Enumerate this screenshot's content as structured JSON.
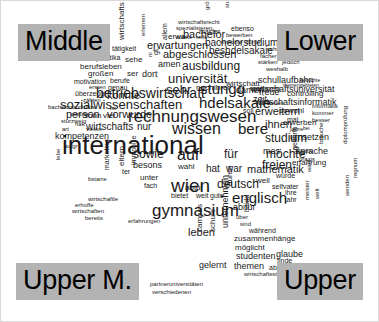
{
  "figure": {
    "type": "word-cloud",
    "title": "",
    "background_color": "#ffffff",
    "text_color": "#1a1a1a",
    "label_background_color": "#b3b3b3"
  },
  "corner_labels": {
    "top_left": "Middle",
    "top_right": "Lower",
    "bottom_left": "Upper M.",
    "bottom_right": "Upper"
  },
  "chart_data": {
    "type": "word-cloud",
    "title": "",
    "xlabel": "",
    "ylabel": "",
    "legend": [],
    "quadrant_labels": [
      "Middle",
      "Lower",
      "Upper M.",
      "Upper"
    ],
    "words": [
      {
        "text": "international",
        "size": 26,
        "x": 62,
        "y": 132,
        "rot": 0
      },
      {
        "text": "rechnungswesen",
        "size": 17,
        "x": 128,
        "y": 108,
        "rot": 0
      },
      {
        "text": "betriebswirtschaft",
        "size": 14,
        "x": 96,
        "y": 86,
        "rot": 0
      },
      {
        "text": "sozialwissenschaften",
        "size": 13,
        "x": 60,
        "y": 98,
        "rot": 0
      },
      {
        "text": "gymnasium",
        "size": 17,
        "x": 152,
        "y": 202,
        "rot": 0
      },
      {
        "text": "wissen",
        "size": 16,
        "x": 172,
        "y": 121,
        "rot": 0
      },
      {
        "text": "wien",
        "size": 19,
        "x": 171,
        "y": 176,
        "rot": 0
      },
      {
        "text": "englisch",
        "size": 15,
        "x": 232,
        "y": 190,
        "rot": 0
      },
      {
        "text": "hdelsakaie",
        "size": 15,
        "x": 199,
        "y": 95,
        "rot": 0
      },
      {
        "text": "stungg",
        "size": 15,
        "x": 200,
        "y": 81,
        "rot": 0
      },
      {
        "text": "auf",
        "size": 16,
        "x": 177,
        "y": 147,
        "rot": 0
      },
      {
        "text": "sehr",
        "size": 13,
        "x": 166,
        "y": 83,
        "rot": 0
      },
      {
        "text": "universität",
        "size": 13,
        "x": 168,
        "y": 72,
        "rot": 0
      },
      {
        "text": "ausbildung",
        "size": 12,
        "x": 182,
        "y": 60,
        "rot": 0
      },
      {
        "text": "abgeschlossen",
        "size": 11,
        "x": 163,
        "y": 49,
        "rot": 0
      },
      {
        "text": "bachelorstudium",
        "size": 10,
        "x": 205,
        "y": 38,
        "rot": 0
      },
      {
        "text": "bachelor",
        "size": 11,
        "x": 183,
        "y": 29,
        "rot": 0
      },
      {
        "text": "erwartungen",
        "size": 11,
        "x": 147,
        "y": 40,
        "rot": 0
      },
      {
        "text": "beshdelsakaie",
        "size": 10,
        "x": 209,
        "y": 46,
        "rot": 0
      },
      {
        "text": "studium",
        "size": 12,
        "x": 265,
        "y": 132,
        "rot": 0
      },
      {
        "text": "erweitern",
        "size": 11,
        "x": 255,
        "y": 106,
        "rot": 0
      },
      {
        "text": "ihnen",
        "size": 11,
        "x": 265,
        "y": 119,
        "rot": 0
      },
      {
        "text": "möchte",
        "size": 12,
        "x": 266,
        "y": 148,
        "rot": 0
      },
      {
        "text": "freien",
        "size": 12,
        "x": 262,
        "y": 159,
        "rot": 0
      },
      {
        "text": "wirtschaftsuniversität",
        "size": 9,
        "x": 251,
        "y": 85,
        "rot": 0
      },
      {
        "text": "wirtschaftsinformatik",
        "size": 9,
        "x": 255,
        "y": 98,
        "rot": 0
      },
      {
        "text": "schullaufbahn",
        "size": 9,
        "x": 258,
        "y": 76,
        "rot": 0
      },
      {
        "text": "bere",
        "size": 15,
        "x": 238,
        "y": 121,
        "rot": 0
      },
      {
        "text": "deutsch",
        "size": 12,
        "x": 217,
        "y": 178,
        "rot": 0
      },
      {
        "text": "mathematik",
        "size": 11,
        "x": 247,
        "y": 164,
        "rot": 0
      },
      {
        "text": "für",
        "size": 12,
        "x": 224,
        "y": 148,
        "rot": 0
      },
      {
        "text": "sowie",
        "size": 12,
        "x": 133,
        "y": 148,
        "rot": 0
      },
      {
        "text": "hat",
        "size": 10,
        "x": 206,
        "y": 164,
        "rot": 0
      },
      {
        "text": "war",
        "size": 10,
        "x": 226,
        "y": 164,
        "rot": 0
      },
      {
        "text": "person",
        "size": 11,
        "x": 66,
        "y": 109,
        "rot": 0
      },
      {
        "text": "vorwurde",
        "size": 11,
        "x": 107,
        "y": 109,
        "rot": 0
      },
      {
        "text": "wirtschafts",
        "size": 10,
        "x": 86,
        "y": 122,
        "rot": 0
      },
      {
        "text": "nur",
        "size": 10,
        "x": 137,
        "y": 122,
        "rot": 0
      },
      {
        "text": "kompetenzen",
        "size": 9,
        "x": 55,
        "y": 132,
        "rot": 0
      },
      {
        "text": "konnte",
        "size": 11,
        "x": 107,
        "y": 90,
        "rot": 0
      },
      {
        "text": "leben",
        "size": 11,
        "x": 188,
        "y": 227,
        "rot": 0
      },
      {
        "text": "zusammenhänge",
        "size": 8,
        "x": 234,
        "y": 235,
        "rot": 0
      },
      {
        "text": "studenten",
        "size": 9,
        "x": 236,
        "y": 252,
        "rot": 0
      },
      {
        "text": "gelernt",
        "size": 9,
        "x": 199,
        "y": 261,
        "rot": 0
      },
      {
        "text": "themen",
        "size": 9,
        "x": 234,
        "y": 262,
        "rot": 0
      },
      {
        "text": "glaube",
        "size": 9,
        "x": 276,
        "y": 250,
        "rot": 0
      },
      {
        "text": "möglicht",
        "size": 8,
        "x": 235,
        "y": 244,
        "rot": 0
      },
      {
        "text": "absolviert",
        "size": 7,
        "x": 269,
        "y": 264,
        "rot": 0
      },
      {
        "text": "wirtschaftsstudium",
        "size": 6,
        "x": 244,
        "y": 271,
        "rot": 0
      },
      {
        "text": "partneruniversitäten",
        "size": 6,
        "x": 150,
        "y": 281,
        "rot": 0
      },
      {
        "text": "verschiedenen",
        "size": 6,
        "x": 152,
        "y": 289,
        "rot": 0
      },
      {
        "text": "während",
        "size": 7,
        "x": 249,
        "y": 227,
        "rot": 0
      },
      {
        "text": "sind",
        "size": 6,
        "x": 240,
        "y": 221,
        "rot": 0
      },
      {
        "text": "über",
        "size": 6,
        "x": 236,
        "y": 214,
        "rot": 0
      },
      {
        "text": "abitur",
        "size": 9,
        "x": 233,
        "y": 203,
        "rot": 0
      },
      {
        "text": "finde",
        "size": 7,
        "x": 277,
        "y": 257,
        "rot": 0
      },
      {
        "text": "gute",
        "size": 7,
        "x": 210,
        "y": 192,
        "rot": 0
      },
      {
        "text": "weit",
        "size": 7,
        "x": 196,
        "y": 192,
        "rot": 0
      },
      {
        "text": "bietet",
        "size": 7,
        "x": 171,
        "y": 192,
        "rot": 0
      },
      {
        "text": "abtur",
        "size": 8,
        "x": 185,
        "y": 184,
        "rot": 0
      },
      {
        "text": "wahl",
        "size": 8,
        "x": 178,
        "y": 163,
        "rot": 0
      },
      {
        "text": "besons",
        "size": 9,
        "x": 133,
        "y": 161,
        "rot": 0
      },
      {
        "text": "weil",
        "size": 8,
        "x": 256,
        "y": 177,
        "rot": 0
      },
      {
        "text": "würde",
        "size": 7,
        "x": 276,
        "y": 172,
        "rot": 0
      },
      {
        "text": "selfvater",
        "size": 7,
        "x": 272,
        "y": 183,
        "rot": 0
      },
      {
        "text": "ihre",
        "size": 7,
        "x": 285,
        "y": 189,
        "rot": 0
      },
      {
        "text": "jahr",
        "size": 7,
        "x": 285,
        "y": 196,
        "rot": 0
      },
      {
        "text": "mes",
        "size": 9,
        "x": 263,
        "y": 147,
        "rot": 0
      },
      {
        "text": "sprache",
        "size": 9,
        "x": 296,
        "y": 147,
        "rot": 0
      },
      {
        "text": "erfahrung",
        "size": 8,
        "x": 292,
        "y": 159,
        "rot": 0
      },
      {
        "text": "zeit",
        "size": 9,
        "x": 253,
        "y": 95,
        "rot": 0
      },
      {
        "text": "umsetzen",
        "size": 9,
        "x": 290,
        "y": 133,
        "rot": 0
      },
      {
        "text": "erwerben",
        "size": 8,
        "x": 283,
        "y": 119,
        "rot": 0
      },
      {
        "text": "sowohl",
        "size": 8,
        "x": 279,
        "y": 107,
        "rot": 0
      },
      {
        "text": "informatik",
        "size": 6,
        "x": 312,
        "y": 103,
        "rot": 0
      },
      {
        "text": "kommer",
        "size": 6,
        "x": 312,
        "y": 110,
        "rot": 0
      },
      {
        "text": "besser",
        "size": 6,
        "x": 312,
        "y": 117,
        "rot": 0
      },
      {
        "text": "jahre",
        "size": 6,
        "x": 290,
        "y": 126,
        "rot": 0
      },
      {
        "text": "bei",
        "size": 5,
        "x": 303,
        "y": 126,
        "rot": 0
      },
      {
        "text": "positiv",
        "size": 6,
        "x": 296,
        "y": 148,
        "rot": 0
      },
      {
        "text": "praxis",
        "size": 6,
        "x": 299,
        "y": 156,
        "rot": 0
      },
      {
        "text": "vorstellen",
        "size": 6,
        "x": 258,
        "y": 100,
        "rot": 0
      },
      {
        "text": "controlling",
        "size": 8,
        "x": 287,
        "y": 90,
        "rot": 0
      },
      {
        "text": "freue",
        "size": 9,
        "x": 259,
        "y": 88,
        "rot": 0
      },
      {
        "text": "themengebieten",
        "size": 5,
        "x": 283,
        "y": 83,
        "rot": 0
      },
      {
        "text": "besuchte",
        "size": 5,
        "x": 300,
        "y": 78,
        "rot": 0
      },
      {
        "text": "weiteren",
        "size": 8,
        "x": 250,
        "y": 85,
        "rot": 0
      },
      {
        "text": "damen",
        "size": 9,
        "x": 236,
        "y": 86,
        "rot": 0
      },
      {
        "text": "nach",
        "size": 8,
        "x": 196,
        "y": 84,
        "rot": 0
      },
      {
        "text": "ihrer",
        "size": 8,
        "x": 214,
        "y": 84,
        "rot": 0
      },
      {
        "text": "mal",
        "size": 7,
        "x": 287,
        "y": 116,
        "rot": 0
      },
      {
        "text": "soll",
        "size": 7,
        "x": 243,
        "y": 107,
        "rot": 0
      },
      {
        "text": "wirtschaft",
        "size": 8,
        "x": 226,
        "y": 80,
        "rot": 0
      },
      {
        "text": "dort",
        "size": 9,
        "x": 142,
        "y": 70,
        "rot": 0
      },
      {
        "text": "ser",
        "size": 8,
        "x": 127,
        "y": 70,
        "rot": 0
      },
      {
        "text": "amen",
        "size": 9,
        "x": 158,
        "y": 60,
        "rot": 0
      },
      {
        "text": "sehe",
        "size": 8,
        "x": 125,
        "y": 56,
        "rot": 0
      },
      {
        "text": "tätigkeit",
        "size": 7,
        "x": 112,
        "y": 45,
        "rot": 0
      },
      {
        "text": "praktika",
        "size": 7,
        "x": 96,
        "y": 54,
        "rot": 0
      },
      {
        "text": "berufsleben",
        "size": 8,
        "x": 80,
        "y": 63,
        "rot": 0
      },
      {
        "text": "großen",
        "size": 8,
        "x": 88,
        "y": 70,
        "rot": 0
      },
      {
        "text": "motivation",
        "size": 7,
        "x": 74,
        "y": 78,
        "rot": 0
      },
      {
        "text": "berufe",
        "size": 7,
        "x": 110,
        "y": 77,
        "rot": 0
      },
      {
        "text": "ersten",
        "size": 6,
        "x": 89,
        "y": 84,
        "rot": 0
      },
      {
        "text": "genau",
        "size": 7,
        "x": 108,
        "y": 84,
        "rot": 0
      },
      {
        "text": "überzeugt",
        "size": 7,
        "x": 75,
        "y": 90,
        "rot": 0
      },
      {
        "text": "zählen",
        "size": 6,
        "x": 83,
        "y": 97,
        "rot": 0
      },
      {
        "text": "bachelorstudiums",
        "size": 6,
        "x": 48,
        "y": 104,
        "rot": 0
      },
      {
        "text": "matura",
        "size": 6,
        "x": 70,
        "y": 111,
        "rot": 0
      },
      {
        "text": "sturzweig",
        "size": 6,
        "x": 61,
        "y": 118,
        "rot": 0
      },
      {
        "text": "art",
        "size": 6,
        "x": 62,
        "y": 126,
        "rot": 0
      },
      {
        "text": "vielen",
        "size": 6,
        "x": 86,
        "y": 126,
        "rot": 0
      },
      {
        "text": "hak",
        "size": 6,
        "x": 75,
        "y": 121,
        "rot": 0
      },
      {
        "text": "sonn",
        "size": 8,
        "x": 84,
        "y": 112,
        "rot": 0
      },
      {
        "text": "viel",
        "size": 8,
        "x": 103,
        "y": 112,
        "rot": 0
      },
      {
        "text": "ist",
        "size": 6,
        "x": 110,
        "y": 105,
        "rot": 0
      },
      {
        "text": "aufgr",
        "size": 6,
        "x": 64,
        "y": 143,
        "rot": 0
      },
      {
        "text": "bstarre",
        "size": 6,
        "x": 88,
        "y": 176,
        "rot": 0
      },
      {
        "text": "wirtschaftle",
        "size": 6,
        "x": 88,
        "y": 196,
        "rot": 0
      },
      {
        "text": "erhoffe",
        "size": 6,
        "x": 75,
        "y": 202,
        "rot": 0
      },
      {
        "text": "wirtschaften",
        "size": 6,
        "x": 72,
        "y": 208,
        "rot": 0
      },
      {
        "text": "bereits",
        "size": 6,
        "x": 85,
        "y": 215,
        "rot": 0
      },
      {
        "text": "erfahrungen",
        "size": 6,
        "x": 128,
        "y": 218,
        "rot": 0
      },
      {
        "text": "fach",
        "size": 7,
        "x": 144,
        "y": 182,
        "rot": 0
      },
      {
        "text": "unter",
        "size": 8,
        "x": 140,
        "y": 174,
        "rot": 0
      },
      {
        "text": "ter",
        "size": 7,
        "x": 122,
        "y": 168,
        "rot": 0
      },
      {
        "text": "wirtschaftsrecht",
        "size": 6,
        "x": 178,
        "y": 19,
        "rot": 0
      },
      {
        "text": "spezialisieren",
        "size": 6,
        "x": 176,
        "y": 25,
        "rot": 0
      },
      {
        "text": "master",
        "size": 7,
        "x": 199,
        "y": 28,
        "rot": 0
      },
      {
        "text": "reife",
        "size": 6,
        "x": 196,
        "y": 34,
        "rot": 0
      },
      {
        "text": "stärke",
        "size": 6,
        "x": 176,
        "y": 34,
        "rot": 0
      },
      {
        "text": "ebenso",
        "size": 7,
        "x": 231,
        "y": 25,
        "rot": 0
      },
      {
        "text": "bewerben",
        "size": 6,
        "x": 226,
        "y": 32,
        "rot": 0
      },
      {
        "text": "entschie",
        "size": 6,
        "x": 220,
        "y": 39,
        "rot": 0
      },
      {
        "text": "durfte",
        "size": 6,
        "x": 245,
        "y": 39,
        "rot": 0
      },
      {
        "text": "schreiben",
        "size": 6,
        "x": 267,
        "y": 46,
        "rot": 0
      },
      {
        "text": "fächer",
        "size": 6,
        "x": 260,
        "y": 53,
        "rot": 0
      },
      {
        "text": "befinde",
        "size": 6,
        "x": 284,
        "y": 53,
        "rot": 0
      },
      {
        "text": "stärken",
        "size": 6,
        "x": 258,
        "y": 59,
        "rot": 0
      },
      {
        "text": "jedoch",
        "size": 6,
        "x": 282,
        "y": 59,
        "rot": 0
      },
      {
        "text": "weshalb",
        "size": 6,
        "x": 266,
        "y": 66,
        "rot": 0
      },
      {
        "text": "wirtschafts",
        "size": 8,
        "x": 118,
        "y": 40,
        "rot": -90
      },
      {
        "text": "erlernen",
        "size": 6,
        "x": 140,
        "y": 36,
        "rot": -90
      },
      {
        "text": "allem",
        "size": 7,
        "x": 161,
        "y": 40,
        "rot": -90
      },
      {
        "text": "erwa",
        "size": 8,
        "x": 168,
        "y": 33,
        "rot": 0
      },
      {
        "text": "gt",
        "size": 7,
        "x": 152,
        "y": 55,
        "rot": -90
      },
      {
        "text": "größten",
        "size": 6,
        "x": 204,
        "y": 10,
        "rot": -90
      },
      {
        "text": "stundet",
        "size": 6,
        "x": 224,
        "y": 8,
        "rot": -90
      },
      {
        "text": "ni",
        "size": 6,
        "x": 147,
        "y": 57,
        "rot": -90
      },
      {
        "text": "marketing",
        "size": 7,
        "x": 103,
        "y": 170,
        "rot": -90
      },
      {
        "text": "eltern",
        "size": 8,
        "x": 118,
        "y": 166,
        "rot": -90
      },
      {
        "text": "immobilie",
        "size": 7,
        "x": 130,
        "y": 165,
        "rot": -90
      },
      {
        "text": "campus",
        "size": 8,
        "x": 196,
        "y": 232,
        "rot": -90
      },
      {
        "text": "schule",
        "size": 8,
        "x": 209,
        "y": 232,
        "rot": -90
      },
      {
        "text": "unternehmen",
        "size": 9,
        "x": 221,
        "y": 228,
        "rot": -90
      },
      {
        "text": "duren",
        "size": 8,
        "x": 226,
        "y": 186,
        "rot": -90
      },
      {
        "text": "bauld",
        "size": 7,
        "x": 243,
        "y": 212,
        "rot": -90
      },
      {
        "text": "ch",
        "size": 7,
        "x": 292,
        "y": 154,
        "rot": -90
      },
      {
        "text": "geehrte",
        "size": 7,
        "x": 291,
        "y": 150,
        "rot": -90
      },
      {
        "text": "brauche",
        "size": 6,
        "x": 318,
        "y": 144,
        "rot": -90
      },
      {
        "text": "diplomprüfung",
        "size": 6,
        "x": 342,
        "y": 144,
        "rot": -90
      },
      {
        "text": "wahl",
        "size": 6,
        "x": 306,
        "y": 172,
        "rot": -90
      },
      {
        "text": "meister",
        "size": 6,
        "x": 304,
        "y": 200,
        "rot": -90
      },
      {
        "text": "regnum",
        "size": 6,
        "x": 352,
        "y": 178,
        "rot": -90
      },
      {
        "text": "wenden",
        "size": 6,
        "x": 344,
        "y": 196,
        "rot": -90
      },
      {
        "text": "lebe",
        "size": 6,
        "x": 55,
        "y": 160,
        "rot": -90
      },
      {
        "text": "welt",
        "size": 6,
        "x": 314,
        "y": 199,
        "rot": -90
      }
    ]
  }
}
